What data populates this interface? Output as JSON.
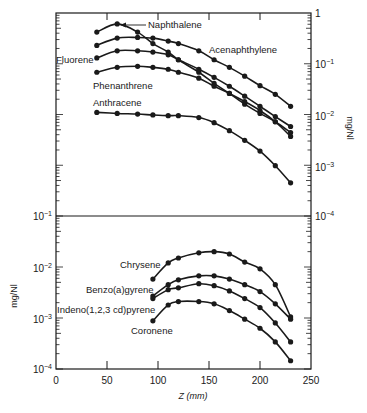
{
  "chart_data": [
    {
      "type": "line",
      "panel": "upper",
      "title": "",
      "xlabel": "Z (mm)",
      "ylabel": "mg/Nl",
      "y_axis_side": "right",
      "yscale": "log",
      "ylim": [
        0.0001,
        1
      ],
      "xlim": [
        0,
        250
      ],
      "y_tick_labels": [
        "1",
        "10^-1",
        "10^-2",
        "10^-3",
        "10^-4"
      ],
      "grid": false,
      "series": [
        {
          "name": "Naphthalene",
          "x": [
            40,
            60,
            80,
            95,
            110,
            120,
            140,
            155,
            170,
            185,
            200,
            215,
            230
          ],
          "values": [
            0.42,
            0.61,
            0.42,
            0.25,
            0.17,
            0.12,
            0.068,
            0.041,
            0.026,
            0.016,
            0.0105,
            0.0072,
            0.0044
          ]
        },
        {
          "name": "Acenaphthylene",
          "x": [
            40,
            60,
            80,
            95,
            110,
            120,
            140,
            155,
            170,
            185,
            200,
            215,
            230
          ],
          "values": [
            0.23,
            0.32,
            0.33,
            0.32,
            0.28,
            0.25,
            0.18,
            0.12,
            0.085,
            0.057,
            0.037,
            0.025,
            0.0145
          ]
        },
        {
          "name": "Fluorene",
          "x": [
            40,
            60,
            80,
            95,
            110,
            120,
            140,
            155,
            170,
            185,
            200,
            215,
            230
          ],
          "values": [
            0.13,
            0.18,
            0.18,
            0.17,
            0.15,
            0.12,
            0.078,
            0.054,
            0.036,
            0.023,
            0.0145,
            0.0091,
            0.0058
          ]
        },
        {
          "name": "Phenanthrene",
          "x": [
            40,
            60,
            80,
            95,
            110,
            120,
            140,
            155,
            170,
            185,
            200,
            215,
            230
          ],
          "values": [
            0.068,
            0.085,
            0.089,
            0.085,
            0.078,
            0.068,
            0.052,
            0.036,
            0.026,
            0.018,
            0.012,
            0.0072,
            0.0037
          ]
        },
        {
          "name": "Anthracene",
          "x": [
            40,
            60,
            80,
            95,
            110,
            120,
            140,
            155,
            170,
            185,
            200,
            215,
            230
          ],
          "values": [
            0.011,
            0.0105,
            0.0102,
            0.0098,
            0.0095,
            0.0095,
            0.0087,
            0.0069,
            0.0048,
            0.0031,
            0.0019,
            0.00098,
            0.00045
          ]
        }
      ]
    },
    {
      "type": "line",
      "panel": "lower",
      "title": "",
      "xlabel": "Z (mm)",
      "ylabel": "mg/Nl",
      "y_axis_side": "left",
      "yscale": "log",
      "ylim": [
        0.0001,
        0.1
      ],
      "xlim": [
        0,
        250
      ],
      "x_tick_labels": [
        "0",
        "50",
        "100",
        "150",
        "200",
        "250"
      ],
      "y_tick_labels": [
        "10^-1",
        "10^-2",
        "10^-3",
        "10^-4"
      ],
      "grid": false,
      "series": [
        {
          "name": "Chrysene",
          "x": [
            95,
            110,
            120,
            140,
            155,
            170,
            185,
            200,
            215,
            230
          ],
          "values": [
            0.0058,
            0.012,
            0.015,
            0.019,
            0.02,
            0.018,
            0.0125,
            0.0092,
            0.0045,
            0.00105
          ]
        },
        {
          "name": "Benzo(a)gyrene",
          "x": [
            95,
            110,
            120,
            140,
            155,
            170,
            185,
            200,
            215,
            230
          ],
          "values": [
            0.0027,
            0.0045,
            0.0056,
            0.0067,
            0.0067,
            0.0058,
            0.0045,
            0.0033,
            0.0019,
            0.00095
          ]
        },
        {
          "name": "Indeno(1,2,3 cd)pyrene",
          "x": [
            95,
            110,
            120,
            140,
            155,
            170,
            185,
            200,
            215,
            230
          ],
          "values": [
            0.0024,
            0.0036,
            0.0039,
            0.0047,
            0.0043,
            0.0034,
            0.0024,
            0.0016,
            0.0008,
            0.00034
          ]
        },
        {
          "name": "Coronene",
          "x": [
            95,
            110,
            120,
            140,
            155,
            170,
            185,
            200,
            215,
            230
          ],
          "values": [
            0.00088,
            0.0018,
            0.0021,
            0.0021,
            0.0019,
            0.0014,
            0.00095,
            0.00063,
            0.00034,
            0.000145
          ]
        }
      ]
    }
  ],
  "labels": {
    "naphthalene": "Naphthalene",
    "acenaphthylene": "Acenaphthylene",
    "fluorene": "Fluorene",
    "phenanthrene": "Phenanthrene",
    "anthracene": "Anthracene",
    "chrysene": "Chrysene",
    "benzo": "Benzo(a)gyrene",
    "indeno": "Indeno(1,2,3 cd)pyrene",
    "coronene": "Coronene",
    "xlabel": "Z (mm)",
    "ylabel_left": "mg/Nl",
    "ylabel_right": "mg/Nl"
  },
  "ticks": {
    "x": [
      "0",
      "50",
      "100",
      "150",
      "200",
      "250"
    ],
    "upper_right": [
      {
        "base": "1",
        "exp": ""
      },
      {
        "base": "10",
        "exp": "−1"
      },
      {
        "base": "10",
        "exp": "−2"
      },
      {
        "base": "10",
        "exp": "−3"
      },
      {
        "base": "10",
        "exp": "−4"
      }
    ],
    "lower_left": [
      {
        "base": "10",
        "exp": "−1"
      },
      {
        "base": "10",
        "exp": "−2"
      },
      {
        "base": "10",
        "exp": "−3"
      },
      {
        "base": "10",
        "exp": "−4"
      }
    ]
  },
  "colors": {
    "ink": "#1a1a1a",
    "background": "#ffffff"
  }
}
